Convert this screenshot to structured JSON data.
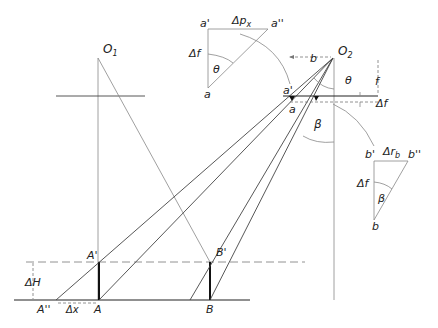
{
  "diagram": {
    "type": "photogrammetry-parallax-geometry",
    "labels": {
      "O1": "O",
      "O1_sub": "1",
      "O2": "O",
      "O2_sub": "2",
      "A": "A",
      "A_prime": "A'",
      "A_double_prime": "A''",
      "B": "B",
      "B_prime": "B'",
      "delta_H": "ΔH",
      "delta_x": "Δx",
      "a": "a",
      "a_prime": "a'",
      "a_double_prime": "a''",
      "b": "b",
      "b_prime": "b'",
      "b_double_prime": "b''",
      "delta_px": "Δp",
      "delta_px_sub": "x",
      "delta_rb": "Δr",
      "delta_rb_sub": "b",
      "delta_f": "Δf",
      "f": "f",
      "theta": "θ",
      "beta": "β",
      "b_baseline": "b"
    },
    "insets": [
      {
        "name": "triangle-a",
        "vertices": [
          "a'",
          "a''",
          "a"
        ],
        "sides": [
          "Δpx",
          "Δf"
        ],
        "angle": "θ"
      },
      {
        "name": "triangle-b",
        "vertices": [
          "b'",
          "b''",
          "b"
        ],
        "sides": [
          "Δrb",
          "Δf"
        ],
        "angle": "β"
      }
    ]
  }
}
